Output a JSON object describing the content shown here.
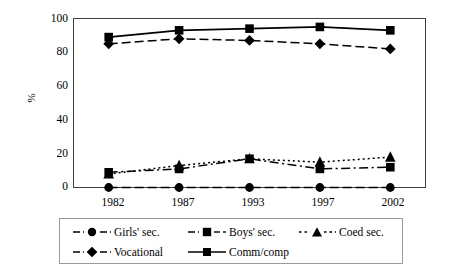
{
  "chart_data": {
    "type": "line",
    "title": "",
    "subtitle": "",
    "xlabel": "",
    "ylabel": "%",
    "categories": [
      "1982",
      "1987",
      "1993",
      "1997",
      "2002"
    ],
    "x": [
      1982,
      1987,
      1993,
      1997,
      2002
    ],
    "ylim": [
      0,
      100
    ],
    "yticks": [
      0,
      20,
      40,
      60,
      80,
      100
    ],
    "ytick_labels": [
      "0",
      "20",
      "40",
      "60",
      "80",
      "100"
    ],
    "grid": false,
    "legend_position": "bottom",
    "series": [
      {
        "name": "Girls' sec.",
        "marker": "circle",
        "linestyle": "dashed",
        "color": "#000000",
        "values": [
          0,
          0,
          0,
          0,
          0
        ]
      },
      {
        "name": "Boys' sec.",
        "marker": "square",
        "linestyle": "dash-dot",
        "color": "#000000",
        "values": [
          9,
          11,
          17,
          11,
          12
        ]
      },
      {
        "name": "Coed sec.",
        "marker": "triangle",
        "linestyle": "dotted",
        "color": "#000000",
        "values": [
          8,
          13,
          17,
          15,
          18
        ]
      },
      {
        "name": "Vocational",
        "marker": "diamond",
        "linestyle": "dashed",
        "color": "#000000",
        "values": [
          85,
          88,
          87,
          85,
          82
        ]
      },
      {
        "name": "Comm/comp",
        "marker": "square",
        "linestyle": "solid",
        "color": "#000000",
        "values": [
          89,
          93,
          94,
          95,
          93
        ]
      }
    ]
  },
  "axes": {
    "ylabel": "%",
    "yticks": [
      "100",
      "80",
      "60",
      "40",
      "20",
      "0"
    ],
    "xticks": [
      "1982",
      "1987",
      "1993",
      "1997",
      "2002"
    ]
  },
  "legend": {
    "row1": [
      {
        "label": "Girls' sec.",
        "marker": "circle-marker-icon",
        "linestyle": "dashed"
      },
      {
        "label": "Boys' sec.",
        "marker": "square-marker-icon",
        "linestyle": "dash-dot"
      },
      {
        "label": "Coed sec.",
        "marker": "triangle-marker-icon",
        "linestyle": "dotted"
      }
    ],
    "row2": [
      {
        "label": "Vocational",
        "marker": "diamond-marker-icon",
        "linestyle": "dashed"
      },
      {
        "label": "Comm/comp",
        "marker": "square-marker-icon",
        "linestyle": "solid"
      }
    ]
  },
  "colors": {
    "ink": "#000000",
    "frame": "#3f3f3f",
    "legend_border": "#9a9a9a"
  }
}
